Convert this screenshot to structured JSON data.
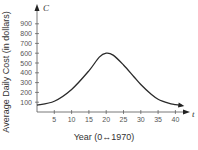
{
  "chart_data": {
    "type": "line",
    "title": "",
    "xlabel": "Year (0↔1970)",
    "ylabel": "Average Daily Cost (in dollars)",
    "x_var": "t",
    "y_var": "C",
    "xlim": [
      0,
      43
    ],
    "ylim": [
      0,
      1000
    ],
    "x_ticks": [
      5,
      10,
      15,
      20,
      25,
      30,
      35,
      40
    ],
    "y_ticks": [
      100,
      200,
      300,
      400,
      500,
      600,
      700,
      800,
      900
    ],
    "grid": false,
    "legend": null,
    "series": [
      {
        "name": "C",
        "x": [
          0,
          5,
          10,
          15,
          18,
          20,
          22,
          25,
          28,
          30,
          33,
          35,
          38,
          40,
          42
        ],
        "values": [
          70,
          110,
          230,
          420,
          560,
          600,
          580,
          480,
          360,
          280,
          180,
          130,
          90,
          75,
          65
        ]
      }
    ],
    "color": "#2a2a2a"
  }
}
